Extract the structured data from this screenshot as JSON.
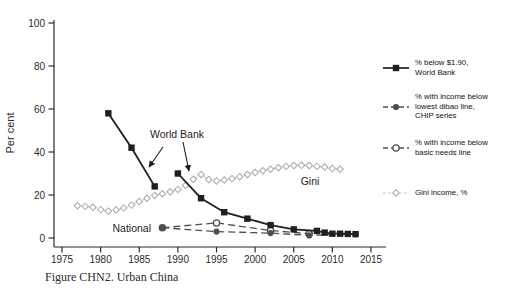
{
  "caption": "Figure CHN2. Urban China",
  "legend": {
    "items": [
      {
        "label": "% below $1.90,\nWorld Bank"
      },
      {
        "label": "% with income below\nlowest dibao line,\nCHIP series"
      },
      {
        "label": "% with income below\nbasic needs line"
      },
      {
        "label": "Gini income, %"
      }
    ]
  },
  "chart_data": {
    "type": "line",
    "title": "",
    "xlabel": "",
    "ylabel": "Per cent",
    "xlim": [
      1973,
      2016
    ],
    "ylim": [
      0,
      100
    ],
    "grid": false,
    "legend_position": "right",
    "x_ticks": [
      1975,
      1980,
      1985,
      1990,
      1995,
      2000,
      2005,
      2010,
      2015
    ],
    "y_ticks": [
      0,
      20,
      40,
      60,
      80,
      100
    ],
    "series": [
      {
        "id": "wb-early",
        "name": "% below $1.90, World Bank (early segment)",
        "z": 3,
        "color": "#1f1f1f",
        "width": 1.8,
        "dash": "",
        "marker": "square",
        "points": [
          [
            1981,
            58
          ],
          [
            1984,
            42
          ],
          [
            1987,
            24
          ]
        ]
      },
      {
        "id": "wb-late",
        "name": "% below $1.90, World Bank (later segment)",
        "z": 4,
        "color": "#1f1f1f",
        "width": 1.8,
        "dash": "",
        "marker": "square",
        "points": [
          [
            1990,
            30
          ],
          [
            1993,
            18.5
          ],
          [
            1996,
            12
          ],
          [
            1999,
            9
          ],
          [
            2002,
            6
          ],
          [
            2005,
            4
          ],
          [
            2008,
            3.3
          ],
          [
            2009,
            2.5
          ],
          [
            2010,
            2
          ],
          [
            2011,
            2
          ],
          [
            2012,
            1.9
          ],
          [
            2013,
            1.8
          ]
        ]
      },
      {
        "id": "dibao",
        "name": "% with income below lowest dibao line, CHIP series",
        "z": 2,
        "color": "#4f4f4f",
        "width": 1.3,
        "dash": "7,4",
        "marker": "circle-filled",
        "points": [
          [
            1988,
            4.8
          ],
          [
            1995,
            3
          ],
          [
            2002,
            2.3
          ],
          [
            2007,
            1.2
          ],
          [
            2013,
            1.8
          ]
        ]
      },
      {
        "id": "basic-needs",
        "name": "% with income below basic needs line",
        "z": 1,
        "color": "#4f4f4f",
        "width": 1.3,
        "dash": "7,4",
        "marker": "circle-open",
        "points": [
          [
            1988,
            4.8
          ],
          [
            1995,
            7
          ],
          [
            2002,
            3.5
          ],
          [
            2007,
            2
          ]
        ]
      },
      {
        "id": "gini",
        "name": "Gini income, %",
        "z": 0,
        "color": "#c6c6c6",
        "marker_color": "#a9a9a9",
        "width": 1.1,
        "dash": "3,2.2",
        "marker": "diamond-open",
        "points": [
          [
            1977,
            15
          ],
          [
            1978,
            14.7
          ],
          [
            1979,
            14.3
          ],
          [
            1980,
            13.2
          ],
          [
            1981,
            12.5
          ],
          [
            1982,
            13
          ],
          [
            1983,
            14
          ],
          [
            1984,
            15.3
          ],
          [
            1985,
            17
          ],
          [
            1986,
            18.5
          ],
          [
            1987,
            19.8
          ],
          [
            1988,
            20.6
          ],
          [
            1989,
            21.5
          ],
          [
            1990,
            22.6
          ],
          [
            1991,
            24.5
          ],
          [
            1992,
            27.3
          ],
          [
            1993,
            29.5
          ],
          [
            1994,
            27.2
          ],
          [
            1995,
            26.5
          ],
          [
            1996,
            27
          ],
          [
            1997,
            27.6
          ],
          [
            1998,
            28.5
          ],
          [
            1999,
            29.5
          ],
          [
            2000,
            30.5
          ],
          [
            2001,
            31.3
          ],
          [
            2002,
            32
          ],
          [
            2003,
            32.7
          ],
          [
            2004,
            33.3
          ],
          [
            2005,
            33.7
          ],
          [
            2006,
            33.8
          ],
          [
            2007,
            33.7
          ],
          [
            2008,
            33.3
          ],
          [
            2009,
            33
          ],
          [
            2010,
            32.3
          ],
          [
            2011,
            32
          ]
        ]
      }
    ],
    "annotations": [
      {
        "text": "World Bank",
        "x": 177,
        "y": 138,
        "anchor": "middle",
        "arrows": [
          [
            163,
            147,
            149,
            167
          ],
          [
            183,
            142,
            189,
            171
          ]
        ]
      },
      {
        "text": "National",
        "x": 151,
        "y": 232,
        "anchor": "end",
        "arrows": []
      },
      {
        "text": "Gini",
        "x": 310,
        "y": 185,
        "anchor": "middle",
        "arrows": []
      }
    ]
  }
}
